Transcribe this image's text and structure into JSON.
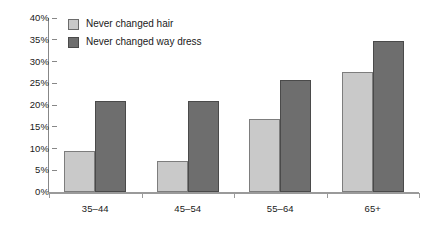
{
  "chart_data": {
    "type": "bar",
    "title": "",
    "subtitle": "",
    "xlabel": "",
    "ylabel": "",
    "categories": [
      "35–44",
      "45–54",
      "55–64",
      "65+"
    ],
    "series": [
      {
        "name": "Never changed hair",
        "color": "#c9c9c9",
        "values": [
          9.5,
          7.2,
          16.7,
          27.7
        ]
      },
      {
        "name": "Never changed way dress",
        "color": "#6e6e6e",
        "values": [
          21.0,
          21.0,
          25.8,
          34.7
        ]
      }
    ],
    "ylim": [
      0,
      40
    ],
    "ytick_values": [
      0,
      5,
      10,
      15,
      20,
      25,
      30,
      35,
      40
    ],
    "ytick_labels": [
      "0%",
      "5%",
      "10%",
      "15%",
      "20%",
      "25%",
      "30%",
      "35%",
      "40%"
    ],
    "grid": false,
    "legend_position": "top-left",
    "value_suffix": "%"
  }
}
